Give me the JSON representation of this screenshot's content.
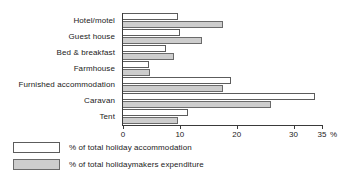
{
  "chart_data": {
    "type": "bar",
    "orientation": "horizontal",
    "title": "",
    "xlabel": "",
    "ylabel": "",
    "xlim": [
      0,
      35
    ],
    "x_suffix": "%",
    "xticks": [
      0,
      10,
      20,
      30,
      35
    ],
    "xtick_labels": [
      "0",
      "10",
      "20",
      "30",
      "35"
    ],
    "grid": false,
    "legend_position": "below-left",
    "categories": [
      "Hotel/motel",
      "Guest house",
      "Bed & breakfast",
      "Farmhouse",
      "Furnished accommodation",
      "Caravan",
      "Tent"
    ],
    "series": [
      {
        "name": "% of total holiday accommodation",
        "color": "#ffffff",
        "values": [
          9.6,
          10.1,
          7.6,
          4.5,
          19.0,
          33.7,
          11.4
        ]
      },
      {
        "name": "% of total holidaymakers expenditure",
        "color": "#cdcdcd",
        "values": [
          17.6,
          13.9,
          8.9,
          4.8,
          17.5,
          26.0,
          9.6
        ]
      }
    ]
  },
  "legend": {
    "items": [
      {
        "label": "% of total holiday accommodation",
        "swatch": "accom"
      },
      {
        "label": "% of total holidaymakers expenditure",
        "swatch": "expend"
      }
    ]
  },
  "axis": {
    "suffix": "%"
  }
}
